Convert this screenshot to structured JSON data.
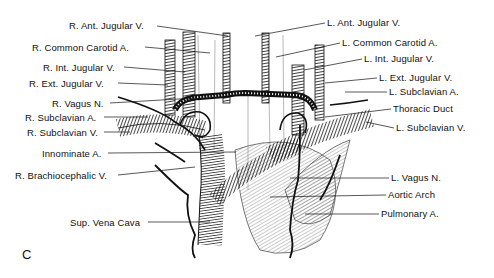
{
  "figure": {
    "panel_letter": "C",
    "labels_left": [
      {
        "text": "R. Ant. Jugular V.",
        "x": 69,
        "y": 20
      },
      {
        "text": "R. Common Carotid A.",
        "x": 32,
        "y": 42
      },
      {
        "text": "R. Int. Jugular V.",
        "x": 43,
        "y": 62
      },
      {
        "text": "R. Ext. Jugular V.",
        "x": 29,
        "y": 78
      },
      {
        "text": "R. Vagus N.",
        "x": 52,
        "y": 98
      },
      {
        "text": "R. Subclavian A.",
        "x": 25,
        "y": 112
      },
      {
        "text": "R. Subclavian V.",
        "x": 27,
        "y": 127
      },
      {
        "text": "Innominate A.",
        "x": 42,
        "y": 148
      },
      {
        "text": "R. Brachiocephalic V.",
        "x": 15,
        "y": 170
      },
      {
        "text": "Sup. Vena Cava",
        "x": 70,
        "y": 217
      }
    ],
    "labels_right": [
      {
        "text": "L. Ant. Jugular V.",
        "x": 327,
        "y": 17
      },
      {
        "text": "L. Common Carotid A.",
        "x": 342,
        "y": 37
      },
      {
        "text": "L. Int. Jugular V.",
        "x": 364,
        "y": 53
      },
      {
        "text": "L. Ext. Jugular V.",
        "x": 379,
        "y": 72
      },
      {
        "text": "L. Subclavian A.",
        "x": 389,
        "y": 86
      },
      {
        "text": "Thoracic Duct",
        "x": 393,
        "y": 103
      },
      {
        "text": "L. Subclavian V.",
        "x": 396,
        "y": 122
      },
      {
        "text": "L. Vagus N.",
        "x": 391,
        "y": 172
      },
      {
        "text": "Aortic Arch",
        "x": 388,
        "y": 189
      },
      {
        "text": "Pulmonary A.",
        "x": 381,
        "y": 208
      }
    ]
  }
}
